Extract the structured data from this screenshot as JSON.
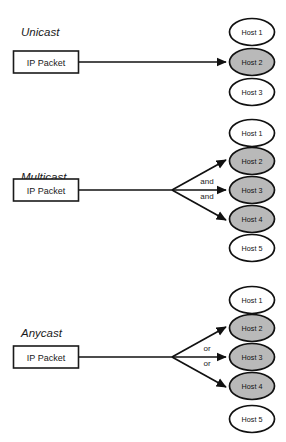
{
  "diagram": {
    "colors": {
      "background": "#ffffff",
      "stroke": "#111111",
      "host_shaded_fill": "#b9b9b9",
      "host_plain_fill": "#ffffff",
      "text": "#1a1a1a"
    },
    "sections": [
      {
        "id": "unicast",
        "label": "Unicast",
        "source_label": "IP Packet",
        "conjunction": null,
        "conjunction_count": 0,
        "hosts": [
          {
            "label": "Host 1",
            "shaded": false,
            "targeted": false
          },
          {
            "label": "Host 2",
            "shaded": true,
            "targeted": true
          },
          {
            "label": "Host 3",
            "shaded": false,
            "targeted": false
          }
        ]
      },
      {
        "id": "multicast",
        "label": "Multicast",
        "source_label": "IP Packet",
        "conjunction": "and",
        "conjunction_count": 2,
        "hosts": [
          {
            "label": "Host 1",
            "shaded": false,
            "targeted": false
          },
          {
            "label": "Host 2",
            "shaded": true,
            "targeted": true
          },
          {
            "label": "Host 3",
            "shaded": true,
            "targeted": true
          },
          {
            "label": "Host 4",
            "shaded": true,
            "targeted": true
          },
          {
            "label": "Host 5",
            "shaded": false,
            "targeted": false
          }
        ]
      },
      {
        "id": "anycast",
        "label": "Anycast",
        "source_label": "IP Packet",
        "conjunction": "or",
        "conjunction_count": 2,
        "hosts": [
          {
            "label": "Host 1",
            "shaded": false,
            "targeted": false
          },
          {
            "label": "Host 2",
            "shaded": true,
            "targeted": true
          },
          {
            "label": "Host 3",
            "shaded": true,
            "targeted": true
          },
          {
            "label": "Host 4",
            "shaded": true,
            "targeted": true
          },
          {
            "label": "Host 5",
            "shaded": false,
            "targeted": false
          }
        ]
      }
    ]
  }
}
